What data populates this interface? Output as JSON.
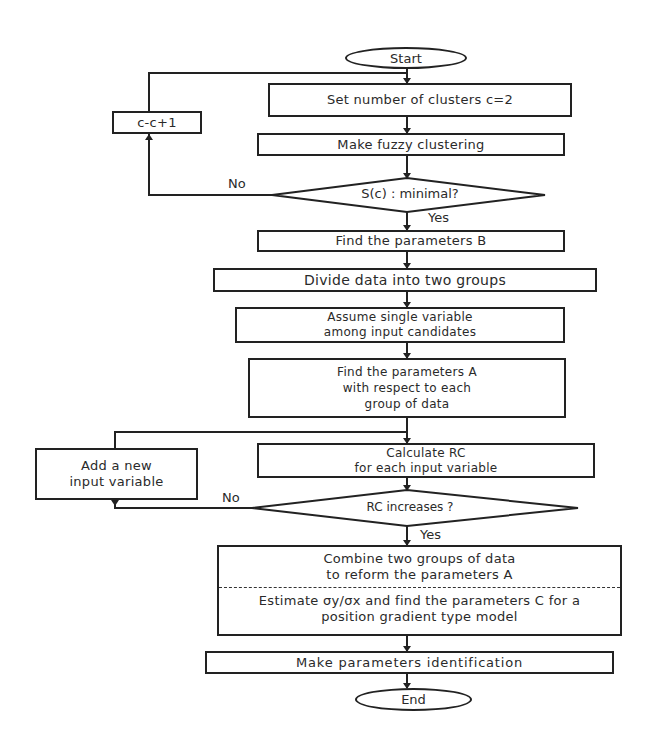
{
  "flowchart": {
    "start": "Start",
    "end": "End",
    "steps": {
      "set_clusters": "Set number of clusters c=2",
      "fuzzy_clustering": "Make fuzzy clustering",
      "increment_c": "c-c+1",
      "find_b": "Find the parameters B",
      "divide": "Divide data into two groups",
      "assume_line1": "Assume single variable",
      "assume_line2": "among input candidates",
      "find_a_line1": "Find the parameters A",
      "find_a_line2": "with respect to each",
      "find_a_line3": "group of data",
      "calc_rc_line1": "Calculate RC",
      "calc_rc_line2": "for each input variable",
      "add_var_line1": "Add a new",
      "add_var_line2": "input variable",
      "combine_line1": "Combine two groups of data",
      "combine_line2": "to reform the parameters A",
      "estimate_line1": "Estimate σy/σx and find the parameters C for a",
      "estimate_line2": "position gradient type model",
      "identify": "Make parameters identification"
    },
    "decisions": {
      "sc_minimal": "S(c) : minimal?",
      "rc_increases": "RC increases ?"
    },
    "branch_labels": {
      "no1": "No",
      "yes1": "Yes",
      "no2": "No",
      "yes2": "Yes"
    }
  }
}
